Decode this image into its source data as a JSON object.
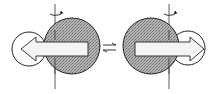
{
  "diagram": {
    "type": "conformational-equilibrium",
    "colors": {
      "stroke": "#222222",
      "large_sphere_fill": "#9a9a9a",
      "small_sphere_fill": "#ffffff",
      "arrow_fill": "#f2f2f2",
      "background": "#ffffff"
    },
    "left_state": {
      "arrow_direction": "left",
      "small_sphere_side": "left",
      "rotation_symbol": "rotation-arrow-icon"
    },
    "right_state": {
      "arrow_direction": "right",
      "small_sphere_side": "right",
      "rotation_symbol": "rotation-arrow-icon"
    },
    "equilibrium_symbol": "⇌"
  }
}
